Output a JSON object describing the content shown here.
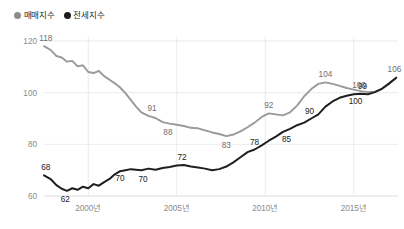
{
  "legend": {
    "items": [
      {
        "label": "매매지수",
        "color": "#8c8c8c",
        "key": "sale"
      },
      {
        "label": "전세지수",
        "color": "#1d1d1d",
        "key": "jeonse"
      }
    ]
  },
  "chart_data": {
    "type": "line",
    "title": "",
    "xlabel": "",
    "ylabel": "",
    "ylim": [
      60,
      120
    ],
    "yticks": [
      120,
      100,
      80,
      60
    ],
    "xticks": [
      "2000년",
      "2005년",
      "2010년",
      "2015년"
    ],
    "xtick_values": [
      2000,
      2005,
      2010,
      2015
    ],
    "xlim": [
      1997.5,
      2017.5
    ],
    "grid": true,
    "legend_position": "top-left",
    "series": [
      {
        "name": "매매지수",
        "color": "#9a9a9a",
        "x": [
          1997.5,
          1997.9,
          1998.2,
          1998.5,
          1998.8,
          1999.1,
          1999.4,
          1999.7,
          2000.0,
          2000.3,
          2000.6,
          2000.9,
          2001.2,
          2001.5,
          2001.8,
          2002.1,
          2002.4,
          2002.7,
          2003.0,
          2003.4,
          2003.8,
          2004.2,
          2004.6,
          2005.0,
          2005.4,
          2005.8,
          2006.2,
          2006.6,
          2007.0,
          2007.4,
          2007.8,
          2008.2,
          2008.6,
          2009.0,
          2009.4,
          2009.8,
          2010.2,
          2010.6,
          2011.0,
          2011.4,
          2011.8,
          2012.2,
          2012.6,
          2013.0,
          2013.4,
          2013.8,
          2014.2,
          2014.6,
          2015.0,
          2015.4,
          2015.8,
          2016.2,
          2016.6,
          2017.0,
          2017.4
        ],
        "y": [
          118.0,
          116.4,
          114.2,
          113.6,
          112.0,
          112.3,
          110.2,
          110.6,
          108.0,
          107.6,
          108.4,
          106.4,
          105.0,
          103.6,
          102.0,
          99.8,
          97.2,
          94.6,
          92.4,
          91.0,
          90.2,
          88.6,
          88.0,
          87.6,
          87.1,
          86.4,
          86.2,
          85.4,
          84.6,
          84.0,
          83.2,
          83.8,
          85.0,
          86.6,
          88.4,
          90.6,
          92.0,
          91.6,
          91.2,
          92.4,
          95.0,
          98.6,
          101.4,
          103.4,
          104.0,
          103.4,
          102.6,
          101.8,
          101.2,
          100.6,
          100.2,
          100.4,
          101.4,
          103.4,
          105.8
        ],
        "labels": [
          {
            "x": 1997.6,
            "y": 118,
            "text": "118"
          },
          {
            "x": 2003.6,
            "y": 91,
            "text": "91"
          },
          {
            "x": 2004.5,
            "y": 88,
            "text": "88"
          },
          {
            "x": 2007.8,
            "y": 83,
            "text": "83"
          },
          {
            "x": 2010.2,
            "y": 92,
            "text": "92"
          },
          {
            "x": 2013.4,
            "y": 104,
            "text": "104"
          },
          {
            "x": 2015.3,
            "y": 100,
            "text": "100"
          },
          {
            "x": 2017.3,
            "y": 106,
            "text": "106"
          }
        ]
      },
      {
        "name": "전세지수",
        "color": "#1f1f1f",
        "x": [
          1997.5,
          1997.9,
          1998.2,
          1998.5,
          1998.8,
          1999.1,
          1999.4,
          1999.7,
          2000.0,
          2000.3,
          2000.6,
          2000.9,
          2001.2,
          2001.5,
          2001.8,
          2002.1,
          2002.4,
          2002.7,
          2003.0,
          2003.4,
          2003.8,
          2004.2,
          2004.6,
          2005.0,
          2005.4,
          2005.8,
          2006.2,
          2006.6,
          2007.0,
          2007.4,
          2007.8,
          2008.2,
          2008.6,
          2009.0,
          2009.4,
          2009.8,
          2010.2,
          2010.6,
          2011.0,
          2011.4,
          2011.8,
          2012.2,
          2012.6,
          2013.0,
          2013.4,
          2013.8,
          2014.2,
          2014.6,
          2015.0,
          2015.4,
          2015.8,
          2016.2,
          2016.6,
          2017.0,
          2017.4
        ],
        "y": [
          68.0,
          66.4,
          64.2,
          62.8,
          62.0,
          63.0,
          62.4,
          63.6,
          63.0,
          64.6,
          64.0,
          65.4,
          66.6,
          68.4,
          69.6,
          70.0,
          70.4,
          70.2,
          70.0,
          70.6,
          70.2,
          70.8,
          71.2,
          71.8,
          72.0,
          71.4,
          71.0,
          70.6,
          70.0,
          70.4,
          71.4,
          73.0,
          75.0,
          77.0,
          78.0,
          79.6,
          81.4,
          83.0,
          84.8,
          86.0,
          87.4,
          88.4,
          90.0,
          91.6,
          94.6,
          96.6,
          98.0,
          98.8,
          99.4,
          99.6,
          99.4,
          100.2,
          101.6,
          103.6,
          105.8
        ],
        "labels": [
          {
            "x": 1997.6,
            "y": 68,
            "text": "68"
          },
          {
            "x": 1998.7,
            "y": 62,
            "text": "62"
          },
          {
            "x": 2001.8,
            "y": 70,
            "text": "70"
          },
          {
            "x": 2005.3,
            "y": 72,
            "text": "72"
          },
          {
            "x": 2003.1,
            "y": 70,
            "text": "70"
          },
          {
            "x": 2009.4,
            "y": 78,
            "text": "78"
          },
          {
            "x": 2011.2,
            "y": 85,
            "text": "85"
          },
          {
            "x": 2012.5,
            "y": 90,
            "text": "90"
          },
          {
            "x": 2015.5,
            "y": 99,
            "text": "99"
          },
          {
            "x": 2015.1,
            "y": 100,
            "text": "100"
          }
        ]
      }
    ]
  }
}
